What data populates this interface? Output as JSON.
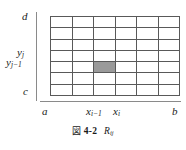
{
  "figure": {
    "caption_mark": "図",
    "caption_number": "4-2",
    "caption_symbol_base": "R",
    "caption_symbol_sub": "ij"
  },
  "axes": {
    "y_axis": {
      "top_label": "d",
      "bottom_label": "c",
      "tick_upper_base": "y",
      "tick_upper_sub": "j",
      "tick_lower_base": "y",
      "tick_lower_sub": "j−1"
    },
    "x_axis": {
      "left_label": "a",
      "right_label": "b",
      "tick_left_base": "x",
      "tick_left_sub": "i−1",
      "tick_right_base": "x",
      "tick_right_sub": "i"
    }
  },
  "grid": {
    "columns": 6,
    "rows": 7,
    "highlighted_cell": {
      "column": 3,
      "row": 5
    },
    "line_color": "#595959",
    "highlight_color": "#9a9a9a",
    "axis_color": "#8a8a8a"
  }
}
